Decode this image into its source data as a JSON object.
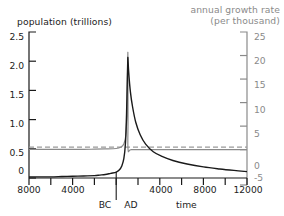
{
  "chart_data": {
    "type": "line",
    "title": "",
    "xlabel": "time",
    "axes": {
      "x": {
        "min": -8000,
        "max": 12000,
        "tick_step": 2000,
        "labeled_ticks": [
          {
            "value": -8000,
            "label": "8000"
          },
          {
            "value": -4000,
            "label": "4000"
          },
          {
            "value": 4000,
            "label": "4000"
          },
          {
            "value": 8000,
            "label": "8000"
          },
          {
            "value": 12000,
            "label": "12000"
          }
        ],
        "era_markers": [
          {
            "label": "BC",
            "value": -900
          },
          {
            "label": "AD",
            "value": 900
          }
        ],
        "divider_value": 0
      },
      "y_left": {
        "label": "population (trillions)",
        "min": 0,
        "max": 2.5,
        "ticks": [
          "0",
          "0.5",
          "1.0",
          "1.5",
          "2.0",
          "2.5"
        ],
        "tick_values": [
          0,
          0.5,
          1.0,
          1.5,
          2.0,
          2.5
        ],
        "color": "#222222"
      },
      "y_right": {
        "label_line1": "annual growth rate",
        "label_line2": "(per thousand)",
        "min": -5,
        "max": 25,
        "ticks": [
          "-5",
          "0",
          "5",
          "10",
          "15",
          "20",
          "25"
        ],
        "tick_values": [
          -5,
          0,
          5,
          10,
          15,
          20,
          25
        ],
        "color": "#8a8a8a"
      }
    },
    "grid": false,
    "legend": null,
    "series": [
      {
        "name": "population",
        "axis": "y_left",
        "color": "#1a1a1a",
        "style": "solid",
        "units": "trillions",
        "points": [
          [
            -8000,
            0.02
          ],
          [
            -7000,
            0.02
          ],
          [
            -6000,
            0.02
          ],
          [
            -5000,
            0.025
          ],
          [
            -4000,
            0.03
          ],
          [
            -3000,
            0.035
          ],
          [
            -2000,
            0.04
          ],
          [
            -1500,
            0.05
          ],
          [
            -1000,
            0.06
          ],
          [
            -500,
            0.08
          ],
          [
            0,
            0.1
          ],
          [
            300,
            0.14
          ],
          [
            500,
            0.2
          ],
          [
            700,
            0.33
          ],
          [
            850,
            0.6
          ],
          [
            950,
            1.1
          ],
          [
            1020,
            1.7
          ],
          [
            1060,
            2.0
          ],
          [
            1075,
            2.05
          ],
          [
            1150,
            1.8
          ],
          [
            1300,
            1.48
          ],
          [
            1500,
            1.22
          ],
          [
            1800,
            0.95
          ],
          [
            2200,
            0.74
          ],
          [
            2700,
            0.58
          ],
          [
            3400,
            0.45
          ],
          [
            4200,
            0.37
          ],
          [
            5200,
            0.3
          ],
          [
            6500,
            0.24
          ],
          [
            8000,
            0.19
          ],
          [
            9500,
            0.155
          ],
          [
            10800,
            0.13
          ],
          [
            12000,
            0.11
          ]
        ]
      },
      {
        "name": "annual growth rate",
        "axis": "y_right",
        "color": "#8a8a8a",
        "style": "solid",
        "units": "per thousand",
        "points": [
          [
            -8000,
            0.05
          ],
          [
            -5000,
            0.06
          ],
          [
            -3000,
            0.08
          ],
          [
            -2000,
            0.1
          ],
          [
            -1000,
            0.15
          ],
          [
            0,
            0.25
          ],
          [
            400,
            0.5
          ],
          [
            700,
            1.2
          ],
          [
            880,
            3.0
          ],
          [
            980,
            7.5
          ],
          [
            1030,
            14.0
          ],
          [
            1060,
            19.0
          ],
          [
            1072,
            20.4
          ],
          [
            1080,
            14.0
          ],
          [
            1085,
            6.0
          ],
          [
            1090,
            0.0
          ],
          [
            1400,
            0.0
          ],
          [
            3000,
            0.0
          ],
          [
            6000,
            0.0
          ],
          [
            9000,
            0.0
          ],
          [
            12000,
            0.0
          ]
        ]
      },
      {
        "name": "zero-reference",
        "axis": "y_right",
        "color": "#9a9a9a",
        "style": "dashed",
        "value": 0.55,
        "points": [
          [
            -8000,
            0.55
          ],
          [
            12000,
            0.55
          ]
        ]
      }
    ]
  },
  "figure": {
    "background": "#ffffff",
    "plot_left_px": 29,
    "plot_right_px": 247,
    "plot_top_px": 32,
    "plot_bottom_px": 178
  }
}
